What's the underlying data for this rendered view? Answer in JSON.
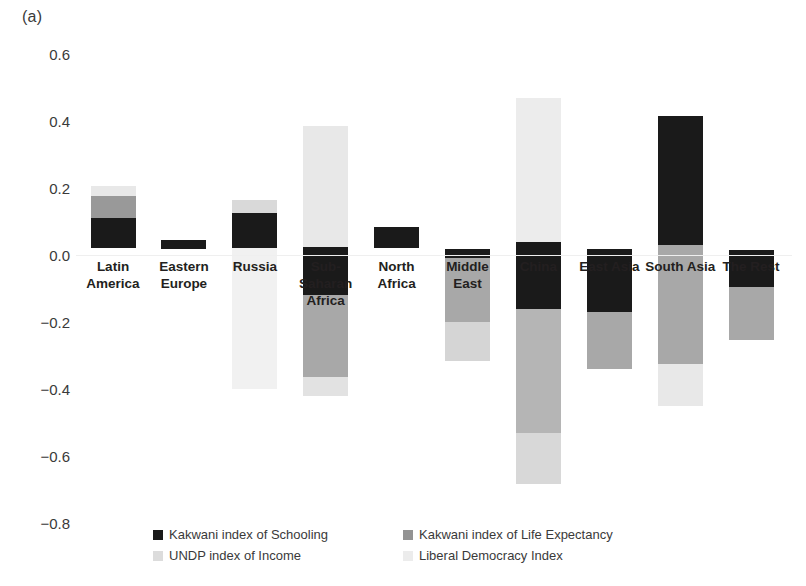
{
  "panel": {
    "label": "(a)"
  },
  "chart_data": {
    "type": "bar",
    "title": "",
    "subtitle": "",
    "xlabel": "",
    "ylabel": "",
    "ylim": [
      -0.8,
      0.6
    ],
    "grid": false,
    "stacked": "floating-range-bars",
    "yticks": [
      "0.6",
      "0.4",
      "0.2",
      "0.0",
      "-0.2",
      "-0.4",
      "-0.6",
      "-0.8"
    ],
    "ytick_values": [
      0.6,
      0.4,
      0.2,
      0.0,
      -0.2,
      -0.4,
      -0.6,
      -0.8
    ],
    "legend_position": "bottom",
    "categories": [
      "Latin America",
      "Eastern Europe",
      "Russia",
      "Sub-Saharan Africa",
      "North Africa",
      "Middle East",
      "China",
      "East Asia",
      "South Asia",
      "The Rest"
    ],
    "series": [
      {
        "name": "Kakwani index of Schooling",
        "color": "#1a1a1a",
        "values": [
          0.11,
          0.015,
          0.115,
          -0.12,
          0.085,
          -0.015,
          -0.16,
          -0.17,
          0.415,
          -0.095
        ]
      },
      {
        "name": "Kakwani index of Life Expectancy",
        "color": "#999999",
        "values": [
          0.175,
          0.0,
          0.0,
          -0.345,
          0.0,
          -0.2,
          -0.53,
          -0.34,
          0.325,
          -0.255
        ]
      },
      {
        "name": "UNDP index of Income",
        "color": "#e0e0e0",
        "values": [
          0.205,
          0.0,
          -0.4,
          -0.42,
          0.0,
          -0.315,
          -0.685,
          0.0,
          0.45,
          0.0
        ]
      },
      {
        "name": "Liberal Democracy Index",
        "color": "#efefef",
        "values": [
          0.0,
          0.0,
          0.17,
          0.385,
          0.0,
          0.0,
          0.47,
          0.0,
          0.0,
          0.0
        ]
      }
    ],
    "bars": [
      {
        "category": "Latin America",
        "label_lines": [
          "Latin",
          "America"
        ],
        "segments": [
          {
            "series": "Liberal Democracy Index",
            "from": 0.205,
            "to": 0.175,
            "color": "#e8e8e8"
          },
          {
            "series": "Kakwani index of Life Expectancy",
            "from": 0.175,
            "to": 0.11,
            "color": "#999999"
          },
          {
            "series": "Kakwani index of Schooling",
            "from": 0.11,
            "to": 0.02,
            "color": "#1a1a1a"
          }
        ]
      },
      {
        "category": "Eastern Europe",
        "label_lines": [
          "Eastern",
          "Europe"
        ],
        "segments": [
          {
            "series": "Kakwani index of Schooling",
            "from": 0.045,
            "to": 0.018,
            "color": "#1a1a1a"
          }
        ]
      },
      {
        "category": "Russia",
        "label_lines": [
          "Russia"
        ],
        "segments": [
          {
            "series": "Liberal Democracy Index",
            "from": 0.165,
            "to": 0.125,
            "color": "#d9d9d9"
          },
          {
            "series": "Kakwani index of Schooling",
            "from": 0.125,
            "to": 0.02,
            "color": "#1a1a1a"
          },
          {
            "series": "UNDP index of Income",
            "from": 0.02,
            "to": -0.4,
            "color": "#f1f1f1"
          }
        ]
      },
      {
        "category": "Sub-Saharan Africa",
        "label_lines": [
          "Sub-",
          "Saharan",
          "Africa"
        ],
        "segments": [
          {
            "series": "Liberal Democracy Index",
            "from": 0.385,
            "to": 0.025,
            "color": "#e8e8e8"
          },
          {
            "series": "Kakwani index of Schooling",
            "from": 0.025,
            "to": -0.12,
            "color": "#1a1a1a"
          },
          {
            "series": "Kakwani index of Life Expectancy",
            "from": -0.12,
            "to": -0.365,
            "color": "#a8a8a8"
          },
          {
            "series": "UNDP index of Income",
            "from": -0.365,
            "to": -0.42,
            "color": "#e2e2e2"
          }
        ]
      },
      {
        "category": "North Africa",
        "label_lines": [
          "North",
          "Africa"
        ],
        "segments": [
          {
            "series": "Kakwani index of Schooling",
            "from": 0.085,
            "to": 0.02,
            "color": "#1a1a1a"
          }
        ]
      },
      {
        "category": "Middle East",
        "label_lines": [
          "Middle",
          "East"
        ],
        "segments": [
          {
            "series": "Kakwani index of Schooling",
            "from": 0.018,
            "to": -0.01,
            "color": "#1a1a1a"
          },
          {
            "series": "Kakwani index of Life Expectancy",
            "from": -0.01,
            "to": -0.2,
            "color": "#a8a8a8"
          },
          {
            "series": "UNDP index of Income",
            "from": -0.2,
            "to": -0.315,
            "color": "#d5d5d5"
          }
        ]
      },
      {
        "category": "China",
        "label_lines": [
          "China"
        ],
        "segments": [
          {
            "series": "Liberal Democracy Index",
            "from": 0.47,
            "to": 0.04,
            "color": "#ececec"
          },
          {
            "series": "Kakwani index of Schooling",
            "from": 0.04,
            "to": -0.16,
            "color": "#1a1a1a"
          },
          {
            "series": "Kakwani index of Life Expectancy",
            "from": -0.16,
            "to": -0.53,
            "color": "#b5b5b5"
          },
          {
            "series": "UNDP index of Income",
            "from": -0.53,
            "to": -0.685,
            "color": "#d8d8d8"
          }
        ]
      },
      {
        "category": "East Asia",
        "label_lines": [
          "East Asia"
        ],
        "segments": [
          {
            "series": "Kakwani index of Schooling",
            "from": 0.018,
            "to": -0.17,
            "color": "#1a1a1a"
          },
          {
            "series": "Kakwani index of Life Expectancy",
            "from": -0.17,
            "to": -0.34,
            "color": "#a8a8a8"
          }
        ]
      },
      {
        "category": "South Asia",
        "label_lines": [
          "South Asia"
        ],
        "segments": [
          {
            "series": "Kakwani index of Schooling",
            "from": 0.415,
            "to": 0.03,
            "color": "#1a1a1a"
          },
          {
            "series": "Kakwani index of Life Expectancy",
            "from": 0.03,
            "to": -0.325,
            "color": "#a8a8a8"
          },
          {
            "series": "UNDP index of Income",
            "from": -0.325,
            "to": -0.45,
            "color": "#e8e8e8"
          }
        ]
      },
      {
        "category": "The Rest",
        "label_lines": [
          "The Rest"
        ],
        "segments": [
          {
            "series": "Kakwani index of Schooling",
            "from": 0.015,
            "to": -0.095,
            "color": "#1a1a1a"
          },
          {
            "series": "Kakwani index of Life Expectancy",
            "from": -0.095,
            "to": -0.255,
            "color": "#a8a8a8"
          }
        ]
      }
    ],
    "legend": [
      {
        "label": "Kakwani index of Schooling",
        "color": "#1a1a1a"
      },
      {
        "label": "Kakwani index of Life Expectancy",
        "color": "#939393"
      },
      {
        "label": "UNDP index of Income",
        "color": "#dcdcdc"
      },
      {
        "label": "Liberal Democracy Index",
        "color": "#ececec"
      }
    ]
  }
}
